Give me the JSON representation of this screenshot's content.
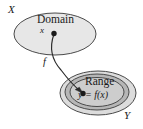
{
  "figure": {
    "type": "function-mapping-diagram",
    "background_color": "#ffffff",
    "stroke_color": "#3a3a3a",
    "labels": {
      "set_x": "X",
      "set_y": "Y",
      "domain": "Domain",
      "range": "Range",
      "point_x": "x",
      "function": "f",
      "equation": "y = f(x)"
    },
    "regions": [
      {
        "name": "domain-ellipse",
        "label": "Domain",
        "set": "X",
        "fill": "#e7e7e7",
        "cx": 55,
        "cy": 34,
        "rx": 41,
        "ry": 21
      },
      {
        "name": "codomain-outer-ellipse",
        "label": "Y",
        "fill": "#dcdcdc",
        "cx": 98,
        "cy": 93,
        "rx": 38,
        "ry": 22
      },
      {
        "name": "codomain-middle-ellipse",
        "fill": "#b9b9b9",
        "cx": 97,
        "cy": 92,
        "rx": 32,
        "ry": 18
      },
      {
        "name": "range-ellipse",
        "label": "Range",
        "fill": "#cfcfcf",
        "cx": 97,
        "cy": 92,
        "rx": 27,
        "ry": 14
      }
    ],
    "points": [
      {
        "name": "point-x",
        "label": "x",
        "cx": 54,
        "cy": 33,
        "r": 2.6
      },
      {
        "name": "point-y",
        "label": "y = f(x)",
        "cx": 83,
        "cy": 93,
        "r": 2.6
      }
    ],
    "arrow": {
      "name": "mapping-arrow",
      "label": "f",
      "from": "point-x",
      "to": "point-y",
      "path": "M 54 34 C 50 48 52 58 62 70 C 68 78 75 86 81 91"
    }
  }
}
